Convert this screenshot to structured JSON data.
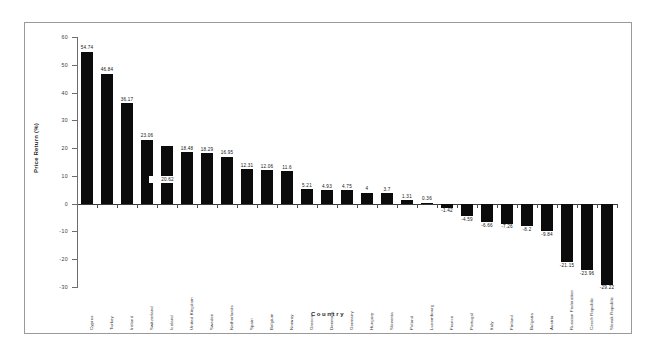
{
  "chart_data": {
    "type": "bar",
    "title": "",
    "xlabel": "Country",
    "ylabel": "Price Return (%)",
    "ylim": [
      -30,
      60
    ],
    "ytick_step": 10,
    "yticks": [
      60,
      50,
      40,
      30,
      20,
      10,
      0,
      -10,
      -20,
      -30
    ],
    "grid": false,
    "legend": "none",
    "bar_color": "#0b0b0b",
    "axis_color": "#6d6d6d",
    "categories": [
      "Cyprus",
      "Turkey",
      "Ireland",
      "Switzerland",
      "Iceland",
      "United Kingdom",
      "Sweden",
      "Netherlands",
      "Spain",
      "Belgium",
      "Norway",
      "Greece",
      "Denmark",
      "Germany",
      "Hungary",
      "Slovenia",
      "Poland",
      "Luxembourg",
      "France",
      "Portugal",
      "Italy",
      "Finland",
      "Bulgaria",
      "Austria",
      "Russian Federation",
      "Czech Republic",
      "Slovak Republic"
    ],
    "values": [
      54.74,
      46.84,
      36.17,
      23.06,
      20.62,
      18.48,
      18.29,
      16.95,
      12.31,
      12.06,
      11.6,
      5.21,
      4.93,
      4.75,
      4,
      3.7,
      1.31,
      0.36,
      -1.42,
      -4.59,
      -6.66,
      -7.26,
      -8.2,
      -9.84,
      -21.15,
      -23.96,
      -29.22
    ],
    "value_labels": [
      "54.74",
      "46.84",
      "36.17",
      "23.06",
      "20.62",
      "18.48",
      "18.29",
      "16.95",
      "12.31",
      "12.06",
      "11.6",
      "5.21",
      "4.93",
      "4.75",
      "4",
      "3.7",
      "1.31",
      "0.36",
      "-1.42",
      "-4.59",
      "-6.66",
      "-7.26",
      "-8.2",
      "-9.84",
      "-21.15",
      "-23.96",
      "-29.22"
    ],
    "label_inside_indices": [
      4
    ]
  }
}
